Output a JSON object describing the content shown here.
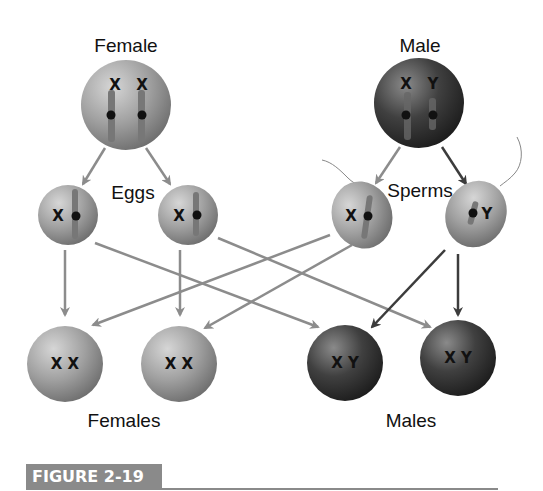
{
  "labels": {
    "female": "Female",
    "male": "Male",
    "eggs": "Eggs",
    "sperms": "Sperms",
    "females": "Females",
    "males": "Males"
  },
  "parents": {
    "female": {
      "chromosomes": [
        "X",
        "X"
      ]
    },
    "male": {
      "chromosomes": [
        "X",
        "Y"
      ]
    }
  },
  "gametes": {
    "eggs": [
      {
        "chromosome": "X"
      },
      {
        "chromosome": "X"
      }
    ],
    "sperms": [
      {
        "chromosome": "X"
      },
      {
        "chromosome": "Y"
      }
    ]
  },
  "offspring": [
    {
      "label": "X X",
      "sex": "female"
    },
    {
      "label": "X X",
      "sex": "female"
    },
    {
      "label": "X Y",
      "sex": "male"
    },
    {
      "label": "X Y",
      "sex": "male"
    }
  ],
  "figure": {
    "label": "FIGURE 2-19"
  },
  "colors": {
    "light_cell": "#9a9a9a",
    "dark_cell": "#3a3a3a",
    "light_arrow": "#8c8c8c",
    "dark_arrow": "#3c3c3c",
    "figure_bar": "#8a8a8a"
  }
}
